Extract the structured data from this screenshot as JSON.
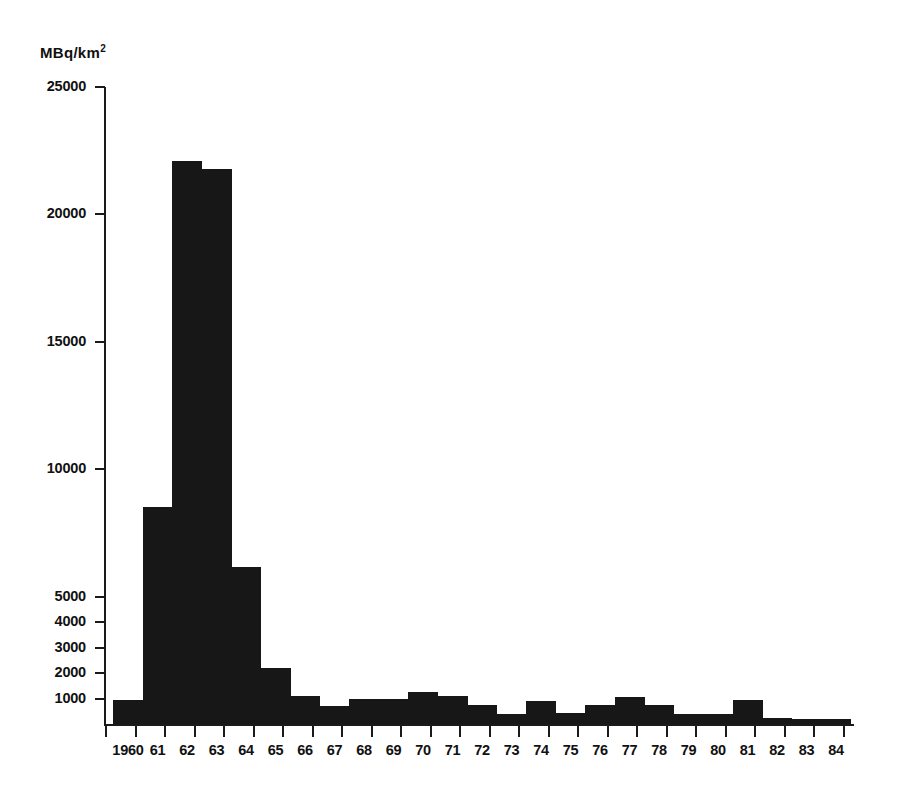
{
  "chart_data": {
    "type": "bar",
    "title": "",
    "subtitle": "",
    "unit_label": "MBq/km",
    "unit_exponent": "2",
    "ylabel": "MBq/km2",
    "xlabel": "",
    "ylim": [
      0,
      25000
    ],
    "grid": false,
    "legend": null,
    "y_major_ticks": [
      25000,
      20000,
      15000,
      10000,
      5000
    ],
    "y_minor_ticks": [
      4000,
      3000,
      2000,
      1000
    ],
    "y_tick_labels": [
      "25000",
      "20000",
      "15000",
      "10000",
      "5000",
      "4000",
      "3000",
      "2000",
      "1000"
    ],
    "y_tick_values": [
      25000,
      20000,
      15000,
      10000,
      5000,
      4000,
      3000,
      2000,
      1000
    ],
    "categories": [
      "1960",
      "61",
      "62",
      "63",
      "64",
      "65",
      "66",
      "67",
      "68",
      "69",
      "70",
      "71",
      "72",
      "73",
      "74",
      "75",
      "76",
      "77",
      "78",
      "79",
      "80",
      "81",
      "82",
      "83",
      "84"
    ],
    "values": [
      950,
      8500,
      22100,
      21800,
      6150,
      2200,
      1100,
      700,
      1000,
      1000,
      1250,
      1100,
      750,
      400,
      900,
      450,
      750,
      1050,
      750,
      400,
      380,
      950,
      220,
      180,
      200
    ],
    "bar_color": "#171717",
    "axis_color": "#1a1a1a",
    "background": "#ffffff"
  },
  "geometry": {
    "plot_left": 104,
    "plot_right": 854,
    "baseline_y": 724,
    "top_y": 87,
    "px_per_unit": 0.02548,
    "bar_width": 30,
    "bar_pitch": 29.5,
    "first_bar_left": 113
  }
}
